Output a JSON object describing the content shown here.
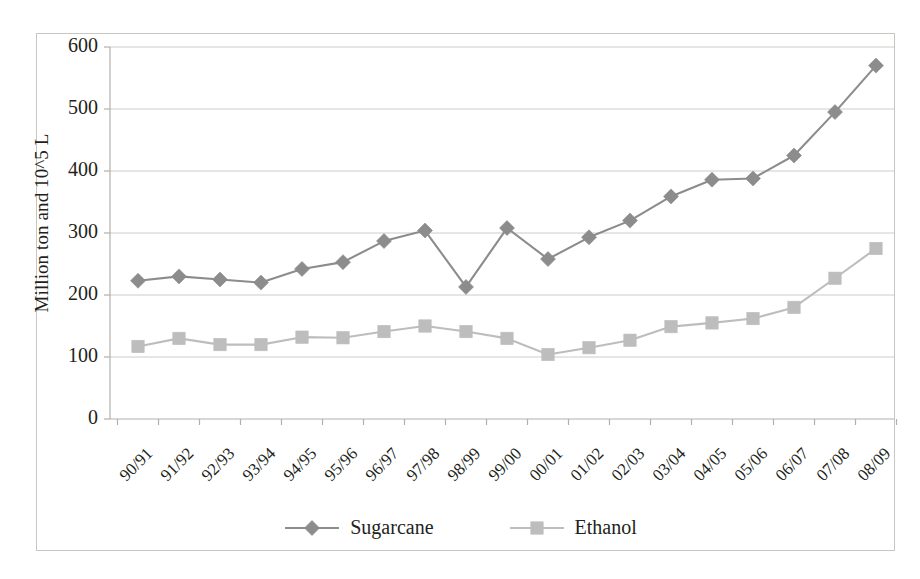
{
  "chart_data": {
    "type": "line",
    "title": "",
    "subtitle": "",
    "xlabel": "",
    "ylabel": "Million ton and 10^5 L",
    "categories": [
      "90/91",
      "91/92",
      "92/93",
      "93/94",
      "94/95",
      "95/96",
      "96/97",
      "97/98",
      "98/99",
      "99/00",
      "00/01",
      "01/02",
      "02/03",
      "03/04",
      "04/05",
      "05/06",
      "06/07",
      "07/08",
      "08/09"
    ],
    "series": [
      {
        "name": "Sugarcane",
        "marker": "diamond",
        "color": "#8c8c8c",
        "values": [
          223,
          230,
          225,
          220,
          242,
          253,
          287,
          304,
          213,
          308,
          258,
          293,
          320,
          359,
          386,
          388,
          425,
          495,
          570
        ]
      },
      {
        "name": "Ethanol",
        "marker": "square",
        "color": "#bdbdbd",
        "values": [
          117,
          130,
          120,
          120,
          132,
          131,
          141,
          150,
          141,
          130,
          104,
          115,
          127,
          149,
          155,
          162,
          180,
          227,
          275
        ]
      }
    ],
    "ylim": [
      0,
      600
    ],
    "yticks": [
      0,
      100,
      200,
      300,
      400,
      500,
      600
    ],
    "ytick_labels": [
      "0",
      "100",
      "200",
      "300",
      "400",
      "500",
      "600"
    ],
    "grid": true,
    "grid_axis": "y",
    "legend_position": "bottom",
    "legend_entries": [
      "Sugarcane",
      "Ethanol"
    ],
    "axis_color": "#b3b0ac",
    "grid_color": "#cfccc8",
    "frame_color": "#c9c6c2",
    "text_color": "#231f20"
  }
}
